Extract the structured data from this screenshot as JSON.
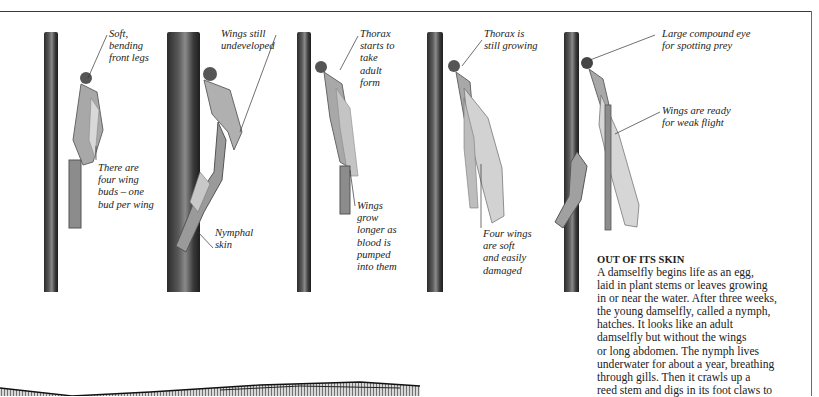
{
  "page": {
    "layout": "book spread excerpt: five-stage damselfly emergence photo sequence with callouts"
  },
  "stages": [
    {
      "id": 1,
      "captions": [
        {
          "name": "soft-front-legs",
          "text": "Soft,\nbending\nfront legs"
        },
        {
          "name": "four-wing-buds",
          "text": "There are\nfour wing\nbuds – one\nbud per wing"
        }
      ]
    },
    {
      "id": 2,
      "captions": [
        {
          "name": "wings-undeveloped",
          "text": "Wings still\nundeveloped"
        },
        {
          "name": "nymphal-skin",
          "text": "Nymphal\nskin"
        }
      ]
    },
    {
      "id": 3,
      "captions": [
        {
          "name": "thorax-adult-form",
          "text": "Thorax\nstarts to\ntake\nadult\nform"
        },
        {
          "name": "wings-grow-longer",
          "text": "Wings\ngrow\nlonger as\nblood is\npumped\ninto them"
        }
      ]
    },
    {
      "id": 4,
      "captions": [
        {
          "name": "thorax-growing",
          "text": "Thorax is\nstill growing"
        },
        {
          "name": "four-wings-soft",
          "text": "Four wings\nare soft\nand easily\ndamaged"
        }
      ]
    },
    {
      "id": 5,
      "captions": [
        {
          "name": "compound-eye",
          "text": "Large compound eye\nfor spotting prey"
        },
        {
          "name": "wings-ready",
          "text": "Wings are ready\nfor weak flight"
        }
      ]
    }
  ],
  "sidebar": {
    "heading": "OUT OF ITS SKIN",
    "body": "A damselfly begins life as an egg,\nlaid in plant stems or leaves growing\nin or near the water. After three weeks,\nthe young damselfly, called a nymph,\nhatches. It looks like an adult\ndamselfly but without the wings\nor long abdomen. The nymph lives\nunderwater for about a year, breathing\nthrough gills. Then it crawls up a\nreed stem and digs in its foot claws to"
  },
  "colors": {
    "frame": "#3a3a3a",
    "text": "#222222",
    "stem_dark": "#2b2b2b",
    "stem_light": "#8a8a8a"
  }
}
